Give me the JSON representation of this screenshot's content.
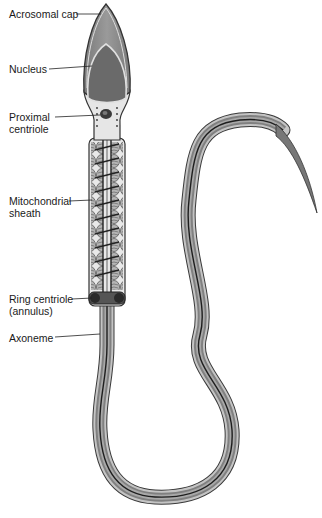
{
  "diagram": {
    "labels": [
      {
        "id": "acrosomal-cap",
        "text": "Acrosomal cap",
        "line2": ""
      },
      {
        "id": "nucleus",
        "text": "Nucleus",
        "line2": ""
      },
      {
        "id": "proximal-centriole",
        "text": "Proximal",
        "line2": "centriole"
      },
      {
        "id": "mitochondrial-sheath",
        "text": "Mitochondrial",
        "line2": "sheath"
      },
      {
        "id": "ring-centriole",
        "text": "Ring centriole",
        "line2": "(annulus)"
      },
      {
        "id": "axoneme",
        "text": "Axoneme",
        "line2": ""
      }
    ],
    "colors": {
      "acrosome": "#8a8a8a",
      "nucleus": "#6e6e6e",
      "cytoplasm": "#e6e6e6",
      "outline": "#3a3a3a",
      "tail_outer": "#bdbdbd",
      "tail_inner": "#7a7a7a",
      "tail_core": "#1e1e1e"
    }
  }
}
